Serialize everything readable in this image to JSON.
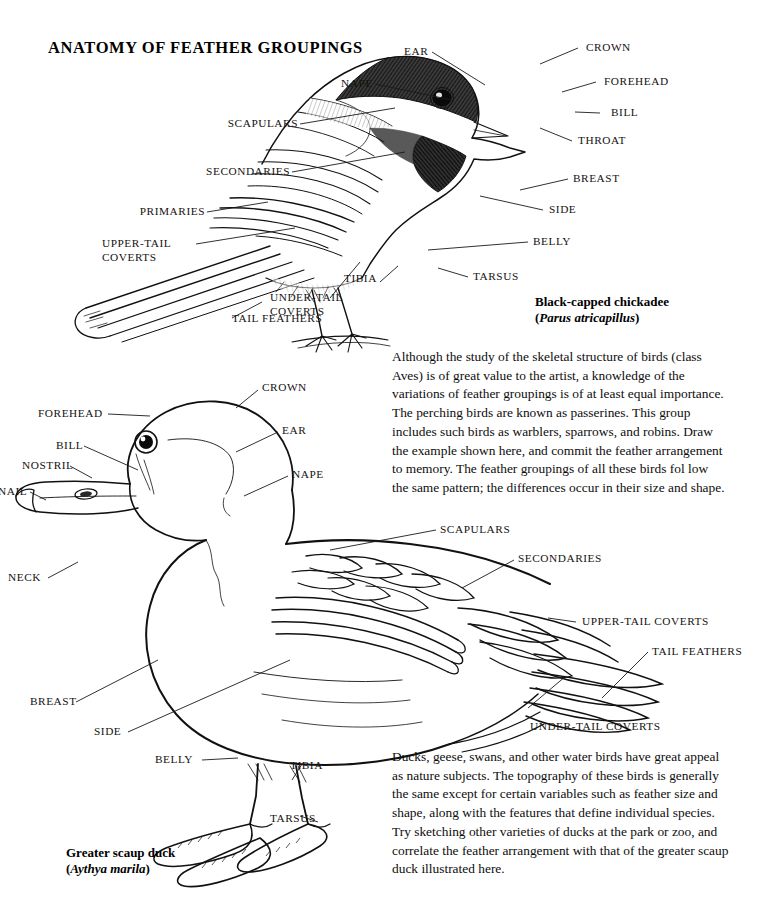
{
  "plate": {
    "title": "ANATOMY OF FEATHER GROUPINGS"
  },
  "chickadee": {
    "caption_common": "Black-capped chickadee",
    "caption_open_paren": "(",
    "caption_scientific": "Parus atricapillus",
    "caption_close_paren": ")",
    "labels_left": [
      {
        "key": "scapulars",
        "text": "SCAPULARS"
      },
      {
        "key": "secondaries",
        "text": "SECONDARIES"
      },
      {
        "key": "primaries",
        "text": "PRIMARIES"
      },
      {
        "key": "upper-tail-coverts",
        "text": "UPPER-TAIL COVERTS"
      },
      {
        "key": "under-tail-coverts",
        "text": "UNDER-TAIL COVERTS"
      },
      {
        "key": "tail-feathers",
        "text": "TAIL FEATHERS"
      }
    ],
    "labels_right": [
      {
        "key": "ear",
        "text": "EAR"
      },
      {
        "key": "crown",
        "text": "CROWN"
      },
      {
        "key": "nape",
        "text": "NAPE"
      },
      {
        "key": "forehead",
        "text": "FOREHEAD"
      },
      {
        "key": "bill",
        "text": "BILL"
      },
      {
        "key": "throat",
        "text": "THROAT"
      },
      {
        "key": "breast",
        "text": "BREAST"
      },
      {
        "key": "side",
        "text": "SIDE"
      },
      {
        "key": "belly",
        "text": "BELLY"
      },
      {
        "key": "tibia",
        "text": "TIBIA"
      },
      {
        "key": "tarsus",
        "text": "TARSUS"
      }
    ]
  },
  "duck": {
    "caption_common": "Greater scaup duck",
    "caption_open_paren": "(",
    "caption_scientific": "Aythya marila",
    "caption_close_paren": ")",
    "labels_left": [
      {
        "key": "forehead",
        "text": "FOREHEAD"
      },
      {
        "key": "bill",
        "text": "BILL"
      },
      {
        "key": "nostril",
        "text": "NOSTRIL"
      },
      {
        "key": "nail",
        "text": "NAIL"
      },
      {
        "key": "neck",
        "text": "NECK"
      },
      {
        "key": "breast",
        "text": "BREAST"
      },
      {
        "key": "side",
        "text": "SIDE"
      },
      {
        "key": "belly",
        "text": "BELLY"
      }
    ],
    "labels_right": [
      {
        "key": "crown",
        "text": "CROWN"
      },
      {
        "key": "ear",
        "text": "EAR"
      },
      {
        "key": "nape",
        "text": "NAPE"
      },
      {
        "key": "scapulars",
        "text": "SCAPULARS"
      },
      {
        "key": "secondaries",
        "text": "SECONDARIES"
      },
      {
        "key": "upper-tail-coverts",
        "text": "UPPER-TAIL COVERTS"
      },
      {
        "key": "tail-feathers",
        "text": "TAIL FEATHERS"
      },
      {
        "key": "under-tail-coverts",
        "text": "UNDER-TAIL COVERTS"
      },
      {
        "key": "tibia",
        "text": "TIBIA"
      },
      {
        "key": "tarsus",
        "text": "TARSUS"
      }
    ]
  },
  "text_blocks": {
    "passerine_paragraph": "Although the study of the skeletal structure of birds (class Aves) is of great value to the artist, a knowledge of the variations of feather groupings is of at least equal importance. The perching birds are known as passerines. This group includes such birds as warblers, sparrows, and robins. Draw the example shown here, and commit the feather arrangement to memory. The feather groupings of all these birds fol low the same pattern; the differences occur in their size and shape.",
    "waterbird_paragraph": "Ducks, geese, swans, and other water birds have great appeal as nature subjects. The topography of these birds is generally the same except for certain variables such as feather size and shape, along with the features that define individual species. Try sketching other varieties of ducks at the park or zoo, and correlate the feather arrangement with that of the greater scaup duck illustrated here."
  },
  "colors": {
    "ink": "#111111",
    "paper": "#ffffff"
  }
}
